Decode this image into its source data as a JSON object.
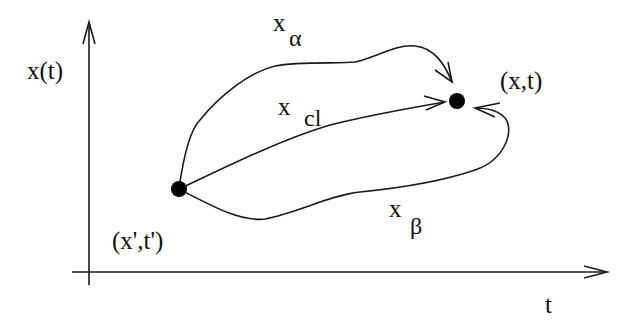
{
  "diagram": {
    "axes": {
      "y_label": "x(t)",
      "x_label": "t"
    },
    "points": {
      "start": "(x',t')",
      "end": "(x,t)"
    },
    "paths": [
      {
        "name": "alpha",
        "base": "x",
        "subscript": "α"
      },
      {
        "name": "classical",
        "base": "x",
        "subscript": "cl"
      },
      {
        "name": "beta",
        "base": "x",
        "subscript": "β"
      }
    ],
    "colors": {
      "stroke": "#1a1a1a",
      "background": "#ffffff"
    }
  }
}
